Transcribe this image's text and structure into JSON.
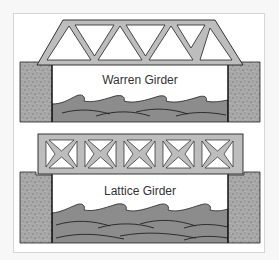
{
  "diagrams": [
    {
      "id": "warren",
      "label": "Warren Girder",
      "truss_type": "warren",
      "panels": 5
    },
    {
      "id": "lattice",
      "label": "Lattice Girder",
      "truss_type": "lattice",
      "panels": 5
    }
  ],
  "colors": {
    "steel": "#bdbdbd",
    "outline": "#222222",
    "abutment": "#a9a9a9",
    "water": "#8c8c8c",
    "sky": "#ffffff",
    "frame_border": "#d6d6d6"
  }
}
